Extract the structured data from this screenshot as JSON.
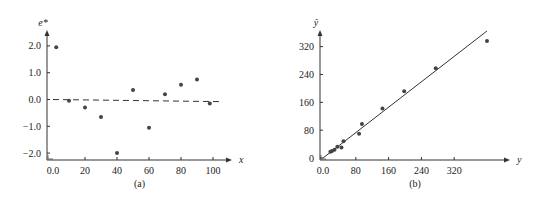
{
  "chart_data": [
    {
      "type": "scatter",
      "panel": "a",
      "caption": "(a)",
      "title": "",
      "xlabel": "x",
      "ylabel": "e*",
      "xlim": [
        0,
        110
      ],
      "ylim": [
        -2.2,
        2.4
      ],
      "xticks": [
        0,
        20,
        40,
        60,
        80,
        100
      ],
      "xtick_labels": [
        "0.0",
        "20",
        "40",
        "60",
        "80",
        "100"
      ],
      "yticks": [
        2.0,
        1.0,
        0.0,
        -1.0,
        -2.0
      ],
      "ytick_labels": [
        "2.0",
        "1.0",
        "0.0",
        "−1.0",
        "−2.0"
      ],
      "grid": false,
      "reference_line": {
        "style": "dashed",
        "y_start": 0.0,
        "y_end": -0.08,
        "x_start": 0,
        "x_end": 105
      },
      "points": [
        {
          "x": 2,
          "y": 1.95
        },
        {
          "x": 10,
          "y": -0.05
        },
        {
          "x": 20,
          "y": -0.3
        },
        {
          "x": 30,
          "y": -0.65
        },
        {
          "x": 40,
          "y": -2.0
        },
        {
          "x": 50,
          "y": 0.35
        },
        {
          "x": 60,
          "y": -1.05
        },
        {
          "x": 70,
          "y": 0.2
        },
        {
          "x": 80,
          "y": 0.55
        },
        {
          "x": 90,
          "y": 0.75
        },
        {
          "x": 98,
          "y": -0.15
        }
      ]
    },
    {
      "type": "scatter",
      "panel": "b",
      "caption": "(b)",
      "title": "",
      "xlabel": "y",
      "ylabel": "ŷ",
      "xlim": [
        0,
        420
      ],
      "ylim": [
        0,
        380
      ],
      "xticks": [
        0,
        80,
        160,
        240,
        320
      ],
      "xtick_labels": [
        "0.0",
        "80",
        "160",
        "240",
        "320"
      ],
      "yticks": [
        320,
        240,
        160,
        80,
        0
      ],
      "ytick_labels": [
        "320",
        "240",
        "160",
        "80",
        "0"
      ],
      "grid": false,
      "fit_line": {
        "style": "solid",
        "x_start": 0,
        "y_start": 0,
        "x_end": 400,
        "y_end": 365
      },
      "points": [
        {
          "x": 18,
          "y": 18
        },
        {
          "x": 22,
          "y": 20
        },
        {
          "x": 28,
          "y": 24
        },
        {
          "x": 35,
          "y": 32
        },
        {
          "x": 45,
          "y": 30
        },
        {
          "x": 50,
          "y": 48
        },
        {
          "x": 88,
          "y": 70
        },
        {
          "x": 95,
          "y": 98
        },
        {
          "x": 145,
          "y": 142
        },
        {
          "x": 198,
          "y": 192
        },
        {
          "x": 275,
          "y": 258
        },
        {
          "x": 400,
          "y": 336
        }
      ]
    }
  ]
}
